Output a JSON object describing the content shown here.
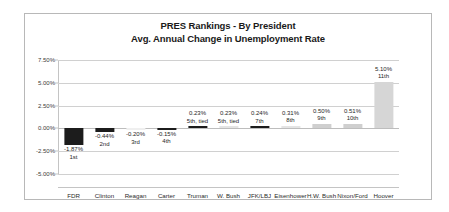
{
  "chart_data": {
    "type": "bar",
    "title": "PRES Rankings - By President",
    "subtitle": "Avg. Annual Change in Unemployment Rate",
    "xlabel": "",
    "ylabel": "",
    "ylim": [
      -5.0,
      7.5
    ],
    "ytick_values": [
      7.5,
      5.0,
      2.5,
      0.0,
      -2.5,
      -5.0
    ],
    "ytick_labels": [
      "7.50%",
      "5.00%",
      "2.50%",
      "0.00%",
      "-2.50%",
      "-5.00%"
    ],
    "grid": true,
    "legend": "none",
    "categories": [
      "FDR",
      "Clinton",
      "Reagan",
      "Carter",
      "Truman",
      "W. Bush",
      "JFK/LBJ",
      "Eisenhower",
      "H.W. Bush",
      "Nixon/Ford",
      "Hoover"
    ],
    "values": [
      -1.87,
      -0.44,
      -0.2,
      -0.15,
      0.23,
      0.23,
      0.24,
      0.31,
      0.5,
      0.51,
      5.1
    ],
    "value_labels": [
      "-1.87%",
      "-0.44%",
      "-0.20%",
      "-0.15%",
      "0.23%",
      "0.23%",
      "0.24%",
      "0.31%",
      "0.50%",
      "0.51%",
      "5.10%"
    ],
    "rank_labels": [
      "1st",
      "2nd",
      "3rd",
      "4th",
      "5th, tied",
      "5th, tied",
      "7th",
      "8th",
      "9th",
      "10th",
      "11th"
    ],
    "bar_shades": [
      "dark",
      "dark",
      "pale",
      "dark",
      "dark",
      "light",
      "dark",
      "light",
      "mid",
      "mid",
      "gray"
    ],
    "colors": {
      "bar_dark": "#1c1c1c",
      "bar_mid": "#cfcfcf",
      "bar_light": "#e4e4e4",
      "bar_pale": "#efefef",
      "bar_gray": "#d6d6d6",
      "gridline": "#d0d0d0",
      "frame_border": "#b8b8b8",
      "text": "#262626"
    }
  }
}
